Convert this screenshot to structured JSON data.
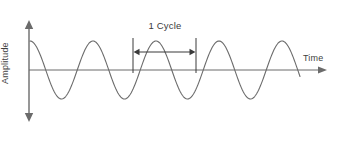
{
  "figure": {
    "background_color": "#ffffff",
    "line_color": "#6b6b6b",
    "text_color": "#3f3f3f"
  },
  "labels": {
    "y_axis": "Amplitude",
    "x_axis": "Time",
    "cycle": "1 Cycle"
  },
  "chart_data": {
    "type": "line",
    "title": "",
    "xlabel": "Time",
    "ylabel": "Amplitude",
    "grid": false,
    "legend": "none",
    "axes": {
      "x_axis_y_pixel": 70,
      "x_axis_start_pixel": 29,
      "x_axis_end_pixel": 327,
      "y_axis_x_pixel": 29,
      "y_axis_top_pixel": 20,
      "y_axis_bottom_pixel": 122,
      "x_arrow": "single-right",
      "y_arrow": "double-vertical",
      "tick_labels_x": [],
      "tick_labels_y": []
    },
    "wave": {
      "form": "cosine",
      "amplitude": 29,
      "period": 63,
      "phase": "peak-at-origin",
      "x_start_pixel": 30,
      "x_end_pixel": 300,
      "baseline_pixel": 70,
      "peak_pixel": 41,
      "trough_pixel": 99,
      "cycles_drawn": 4.3,
      "samples": 280
    },
    "annotation": {
      "label": "1 Cycle",
      "marker_left_x": 133,
      "marker_right_x": 196,
      "marker_top_y": 38,
      "marker_bottom_y": 73,
      "arrow_y": 52,
      "span_pixels": 63,
      "arrow_style": "double-headed"
    }
  }
}
